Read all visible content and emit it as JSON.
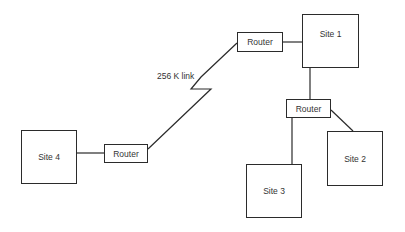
{
  "diagram": {
    "type": "network-topology",
    "nodes": [
      {
        "id": "site1",
        "label": "Site 1",
        "kind": "site"
      },
      {
        "id": "site2",
        "label": "Site 2",
        "kind": "site"
      },
      {
        "id": "site3",
        "label": "Site 3",
        "kind": "site"
      },
      {
        "id": "site4",
        "label": "Site 4",
        "kind": "site"
      },
      {
        "id": "router1",
        "label": "Router",
        "kind": "router"
      },
      {
        "id": "router2",
        "label": "Router",
        "kind": "router"
      },
      {
        "id": "router4",
        "label": "Router",
        "kind": "router"
      }
    ],
    "edges": [
      {
        "from": "router1",
        "to": "site1"
      },
      {
        "from": "site1",
        "to": "router2"
      },
      {
        "from": "router2",
        "to": "site2"
      },
      {
        "from": "router2",
        "to": "site3"
      },
      {
        "from": "site4",
        "to": "router4"
      },
      {
        "from": "router4",
        "to": "router1",
        "label": "256 K link",
        "style": "wan-zigzag"
      }
    ],
    "link_label": "256 K link"
  }
}
